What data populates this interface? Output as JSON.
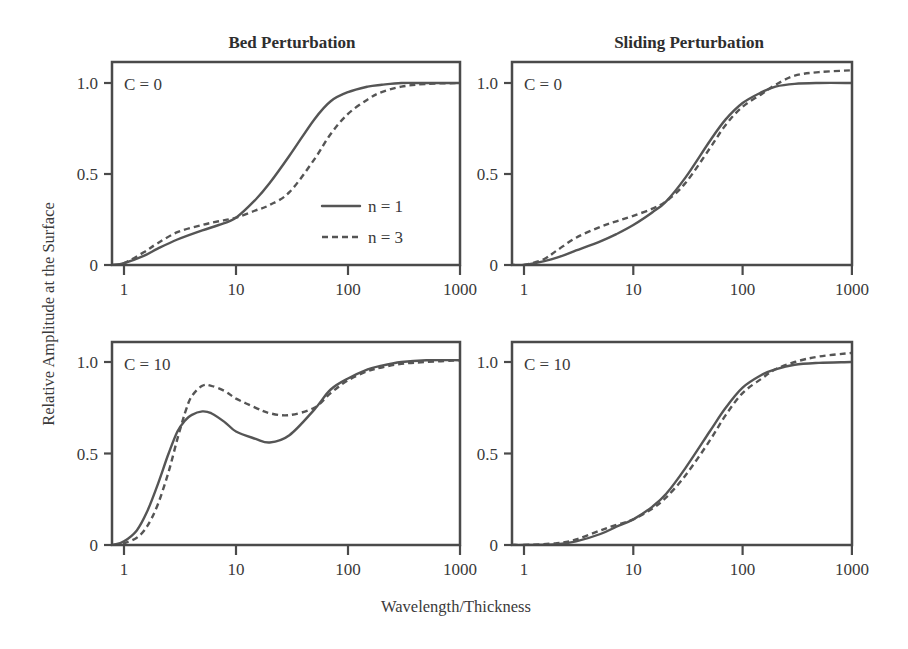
{
  "chart_data": [
    {
      "type": "line",
      "title": "Bed Perturbation",
      "panel_label": "C = 0",
      "xlabel": "Wavelength/Thickness",
      "ylabel": "Relative Amplitude at the Surface",
      "xscale": "log",
      "xlim": [
        0.8,
        1000
      ],
      "ylim": [
        0,
        1.1
      ],
      "xticks": [
        "1",
        "10",
        "100",
        "1000"
      ],
      "yticks": [
        "0",
        "0.5",
        "1.0"
      ],
      "legend": [
        "n = 1",
        "n = 3"
      ],
      "series": [
        {
          "name": "n = 1",
          "style": "solid",
          "x": [
            0.8,
            1,
            1.5,
            2,
            3,
            5,
            7,
            10,
            15,
            20,
            30,
            50,
            70,
            100,
            150,
            200,
            300,
            500,
            1000
          ],
          "y": [
            0.0,
            0.01,
            0.05,
            0.09,
            0.14,
            0.19,
            0.22,
            0.26,
            0.36,
            0.45,
            0.6,
            0.8,
            0.9,
            0.95,
            0.98,
            0.99,
            1.0,
            1.0,
            1.0
          ]
        },
        {
          "name": "n = 3",
          "style": "dashed",
          "x": [
            0.8,
            1,
            1.5,
            2,
            3,
            5,
            7,
            10,
            15,
            20,
            30,
            50,
            70,
            100,
            150,
            200,
            300,
            500,
            1000
          ],
          "y": [
            0.0,
            0.01,
            0.07,
            0.12,
            0.18,
            0.22,
            0.24,
            0.26,
            0.3,
            0.33,
            0.4,
            0.58,
            0.72,
            0.83,
            0.91,
            0.95,
            0.98,
            0.995,
            1.0
          ]
        }
      ]
    },
    {
      "type": "line",
      "title": "Sliding Perturbation",
      "panel_label": "C = 0",
      "xscale": "log",
      "xlim": [
        0.8,
        1000
      ],
      "ylim": [
        0,
        1.1
      ],
      "xticks": [
        "1",
        "10",
        "100",
        "1000"
      ],
      "yticks": [
        "0",
        "0.5",
        "1.0"
      ],
      "series": [
        {
          "name": "n = 1",
          "style": "solid",
          "x": [
            0.8,
            1,
            1.5,
            2,
            3,
            5,
            7,
            10,
            15,
            20,
            30,
            50,
            70,
            100,
            150,
            200,
            300,
            500,
            1000
          ],
          "y": [
            0.0,
            0.0,
            0.02,
            0.04,
            0.08,
            0.13,
            0.17,
            0.22,
            0.29,
            0.35,
            0.48,
            0.68,
            0.8,
            0.89,
            0.95,
            0.98,
            0.995,
            1.0,
            1.0
          ]
        },
        {
          "name": "n = 3",
          "style": "dashed",
          "x": [
            0.8,
            1,
            1.5,
            2,
            3,
            5,
            7,
            10,
            15,
            20,
            30,
            50,
            70,
            100,
            150,
            200,
            300,
            500,
            1000
          ],
          "y": [
            0.0,
            0.0,
            0.03,
            0.08,
            0.15,
            0.21,
            0.24,
            0.27,
            0.31,
            0.35,
            0.45,
            0.64,
            0.77,
            0.87,
            0.94,
            0.99,
            1.04,
            1.06,
            1.07
          ]
        }
      ]
    },
    {
      "type": "line",
      "title": "Bed Perturbation",
      "panel_label": "C = 10",
      "xscale": "log",
      "xlim": [
        0.8,
        1000
      ],
      "ylim": [
        0,
        1.1
      ],
      "xticks": [
        "1",
        "10",
        "100",
        "1000"
      ],
      "yticks": [
        "0",
        "0.5",
        "1.0"
      ],
      "series": [
        {
          "name": "n = 1",
          "style": "solid",
          "x": [
            0.8,
            1,
            1.3,
            1.6,
            2,
            2.5,
            3,
            3.5,
            4,
            5,
            6,
            8,
            10,
            15,
            20,
            30,
            50,
            70,
            100,
            150,
            200,
            300,
            500,
            1000
          ],
          "y": [
            0.0,
            0.02,
            0.08,
            0.18,
            0.33,
            0.5,
            0.62,
            0.68,
            0.71,
            0.73,
            0.72,
            0.67,
            0.62,
            0.58,
            0.56,
            0.6,
            0.74,
            0.85,
            0.91,
            0.96,
            0.98,
            1.0,
            1.01,
            1.01
          ]
        },
        {
          "name": "n = 3",
          "style": "dashed",
          "x": [
            0.8,
            1,
            1.3,
            1.6,
            2,
            2.5,
            3,
            3.5,
            4,
            5,
            6,
            8,
            10,
            15,
            20,
            30,
            50,
            70,
            100,
            150,
            200,
            300,
            500,
            1000
          ],
          "y": [
            0.0,
            0.01,
            0.04,
            0.1,
            0.22,
            0.4,
            0.58,
            0.72,
            0.81,
            0.87,
            0.87,
            0.84,
            0.8,
            0.75,
            0.72,
            0.71,
            0.75,
            0.83,
            0.9,
            0.95,
            0.97,
            0.99,
            1.0,
            1.01
          ]
        }
      ]
    },
    {
      "type": "line",
      "title": "Sliding Perturbation",
      "panel_label": "C = 10",
      "xscale": "log",
      "xlim": [
        0.8,
        1000
      ],
      "ylim": [
        0,
        1.1
      ],
      "xticks": [
        "1",
        "10",
        "100",
        "1000"
      ],
      "yticks": [
        "0",
        "0.5",
        "1.0"
      ],
      "series": [
        {
          "name": "n = 1",
          "style": "solid",
          "x": [
            0.8,
            1,
            2,
            3,
            5,
            7,
            10,
            15,
            20,
            30,
            50,
            70,
            100,
            150,
            200,
            300,
            500,
            1000
          ],
          "y": [
            0.0,
            0.0,
            0.005,
            0.02,
            0.06,
            0.1,
            0.14,
            0.21,
            0.28,
            0.42,
            0.62,
            0.75,
            0.86,
            0.93,
            0.96,
            0.985,
            0.995,
            1.0
          ]
        },
        {
          "name": "n = 3",
          "style": "dashed",
          "x": [
            0.8,
            1,
            2,
            3,
            5,
            7,
            10,
            15,
            20,
            30,
            50,
            70,
            100,
            150,
            200,
            300,
            500,
            1000
          ],
          "y": [
            0.0,
            0.0,
            0.01,
            0.03,
            0.08,
            0.11,
            0.14,
            0.2,
            0.26,
            0.38,
            0.57,
            0.71,
            0.83,
            0.91,
            0.96,
            1.0,
            1.03,
            1.05
          ]
        }
      ]
    }
  ],
  "figure": {
    "col_titles": [
      "Bed Perturbation",
      "Sliding Perturbation"
    ],
    "ylabel": "Relative Amplitude at the Surface",
    "xlabel": "Wavelength/Thickness",
    "legend": {
      "solid_label": "n = 1",
      "dashed_label": "n = 3"
    },
    "line_color": "#555555",
    "frame_color": "#4a4a4a"
  }
}
